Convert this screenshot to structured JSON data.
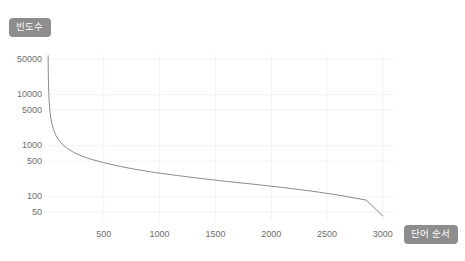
{
  "chart_data": {
    "type": "line",
    "title": "",
    "subtitle": "",
    "xlabel": "단어 순서",
    "ylabel": "빈도수",
    "yscale": "log",
    "xscale": "linear",
    "grid": true,
    "legend": null,
    "xlim": [
      0,
      3100
    ],
    "ylim": [
      35,
      60000
    ],
    "xticks": [
      500,
      1000,
      1500,
      2000,
      2500,
      3000
    ],
    "xtick_labels": [
      "500",
      "1000",
      "1500",
      "2000",
      "2500",
      "3000"
    ],
    "yticks": [
      50,
      100,
      500,
      1000,
      5000,
      10000,
      50000
    ],
    "ytick_labels": [
      "50",
      "100",
      "500",
      "1000",
      "5000",
      "10000",
      "50000"
    ],
    "series": [
      {
        "name": "word frequency",
        "color": "#8a8a8a",
        "x": [
          1,
          2,
          3,
          5,
          8,
          12,
          18,
          25,
          35,
          50,
          70,
          95,
          130,
          175,
          230,
          300,
          390,
          500,
          630,
          780,
          950,
          1150,
          1370,
          1600,
          1850,
          2100,
          2350,
          2600,
          2850,
          3000
        ],
        "y": [
          58000,
          34000,
          24000,
          15000,
          9500,
          6600,
          4600,
          3500,
          2700,
          2050,
          1600,
          1300,
          1060,
          880,
          740,
          630,
          540,
          465,
          400,
          345,
          300,
          262,
          228,
          200,
          175,
          152,
          130,
          108,
          86,
          42
        ]
      }
    ]
  },
  "axis_titles": {
    "y": "빈도수",
    "x": "단어 순서"
  },
  "colors": {
    "line": "#8a8a8a",
    "grid": "#f2f2f2",
    "badge_bg": "#8d8d8d",
    "badge_text": "#ffffff",
    "tick_text": "#6e6e6e",
    "background": "#ffffff"
  }
}
